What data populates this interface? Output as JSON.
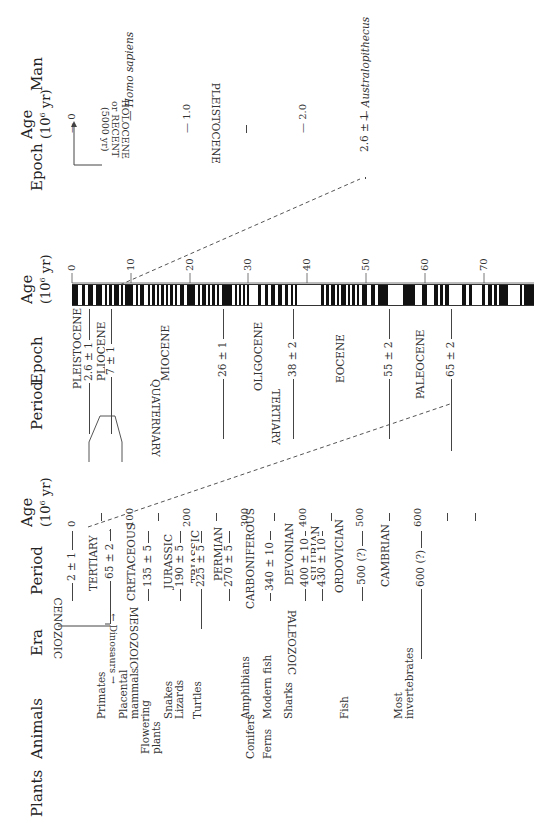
{
  "section_lower": {
    "headers": {
      "plants": "Plants",
      "animals": "Animals",
      "era": "Era",
      "period": "Period",
      "age_line1": "Age",
      "age_line2": "(10",
      "age_exp": "6",
      "age_unit": " yr)"
    },
    "age_ticks": [
      "0",
      "100",
      "200",
      "300",
      "400",
      "500",
      "600"
    ],
    "plants": [
      "Flowering",
      "plants",
      "Conifers",
      "Ferns"
    ],
    "animals": [
      "Primates",
      "Placental",
      "mammals",
      "Snakes",
      "Lizards",
      "Turtles",
      "Amphibians",
      "Modern fish",
      "Sharks",
      "Fish",
      "Most",
      "invertebrates"
    ],
    "dinosaurs": "Dinosaurs",
    "eras": [
      "CENOZOIC",
      "MESOZOIC",
      "PALEOZOIC"
    ],
    "periods": [
      "TERTIARY",
      "CRETACEOUS",
      "JURASSIC",
      "TRIASSIC",
      "PERMIAN",
      "CARBONIFEROUS",
      "DEVONIAN",
      "SILURIAN",
      "ORDOVICIAN",
      "CAMBRIAN"
    ],
    "boundaries": [
      "2 ± 1",
      "65 ± 2",
      "135 ± 5",
      "190 ± 5",
      "225 ± 5",
      "270 ± 5",
      "340 ± 10",
      "400 ± 10",
      "430 ± 10",
      "500 (?)",
      "600 (?)"
    ]
  },
  "section_middle": {
    "headers": {
      "period": "Period",
      "epoch": "Epoch",
      "age_line1": "Age",
      "age_line2": "(10",
      "age_exp": "6",
      "age_unit": " yr)"
    },
    "periods": [
      "QUATERNARY",
      "TERTIARY"
    ],
    "epochs": [
      "PLEISTOCENE",
      "PLIOCENE",
      "MIOCENE",
      "OLIGOCENE",
      "EOCENE",
      "PALEOCENE"
    ],
    "boundaries": [
      "2.6 ± 1",
      "7 ± 1",
      "26 ± 1",
      "38 ± 2",
      "55 ± 2",
      "65 ± 2"
    ],
    "age_ticks": [
      "0",
      "10",
      "20",
      "30",
      "40",
      "50",
      "60",
      "70"
    ]
  },
  "section_upper": {
    "headers": {
      "epoch": "Epoch",
      "age_line1": "Age",
      "age_line2": "(10",
      "age_exp": "6",
      "age_unit": " yr)",
      "man": "Man"
    },
    "epochs": [
      "HOLOCENE",
      "or RECENT",
      "(5000 yr)",
      "PLEISTOCENE"
    ],
    "boundary": "2.6 ± 1",
    "age_ticks": [
      "0",
      "1.0",
      "2.0"
    ],
    "man": [
      "Homo sapiens",
      "Australopithecus"
    ]
  }
}
